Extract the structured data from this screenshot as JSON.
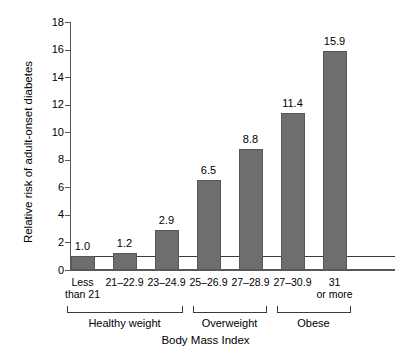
{
  "chart_data": {
    "type": "bar",
    "title": "",
    "xlabel": "Body Mass Index",
    "ylabel": "Relative risk of adult-onset diabetes",
    "categories": [
      "Less\nthan 21",
      "21–22.9",
      "23–24.9",
      "25–26.9",
      "27–28.9",
      "27–30.9",
      "31\nor more"
    ],
    "category_lines": [
      [
        "Less",
        "than 21"
      ],
      [
        "21–22.9"
      ],
      [
        "23–24.9"
      ],
      [
        "25–26.9"
      ],
      [
        "27–28.9"
      ],
      [
        "27–30.9"
      ],
      [
        "31",
        "or more"
      ]
    ],
    "values": [
      1.0,
      1.2,
      2.9,
      6.5,
      8.8,
      11.4,
      15.9
    ],
    "value_labels": [
      "1.0",
      "1.2",
      "2.9",
      "6.5",
      "8.8",
      "11.4",
      "15.9"
    ],
    "ylim": [
      0,
      18
    ],
    "yticks": [
      0,
      2,
      4,
      6,
      8,
      10,
      12,
      14,
      16,
      18
    ],
    "ytick_labels": [
      "0",
      "2",
      "4",
      "6",
      "8",
      "10",
      "12",
      "14",
      "16",
      "18"
    ],
    "grid": false,
    "legend": "none",
    "reference_line": 1.0,
    "bar_color": "#6e6e70",
    "bar_edge_color": "#58585a",
    "axis_color": "#58585a",
    "groups": [
      {
        "label": "Healthy weight",
        "start_index": 0,
        "end_index": 2
      },
      {
        "label": "Overweight",
        "start_index": 3,
        "end_index": 4
      },
      {
        "label": "Obese",
        "start_index": 5,
        "end_index": 6
      }
    ]
  }
}
